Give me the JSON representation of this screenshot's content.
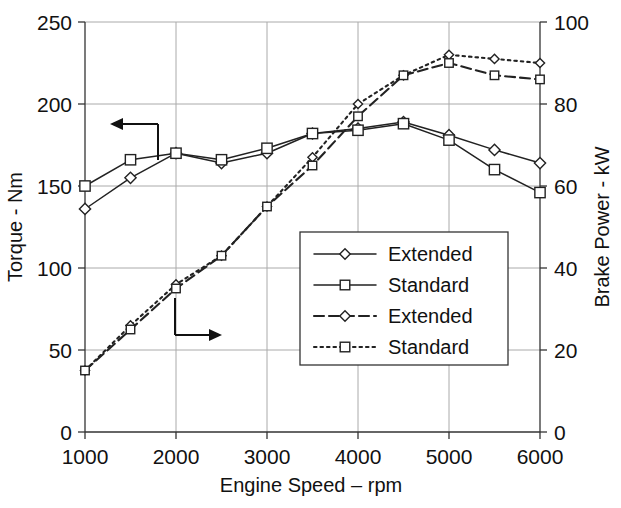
{
  "chart_data": {
    "type": "line",
    "title": "",
    "xlabel": "Engine Speed – rpm",
    "ylabel": "Torque - Nm",
    "y2label": "Brake Power - kW",
    "x": [
      1000,
      1500,
      2000,
      2500,
      3000,
      3500,
      4000,
      4500,
      5000,
      5500,
      6000
    ],
    "xlim": [
      1000,
      6000
    ],
    "ylim": [
      0,
      250
    ],
    "y2lim": [
      0,
      100
    ],
    "xticks": [
      "1000",
      "2000",
      "3000",
      "4000",
      "5000",
      "6000"
    ],
    "yticks": [
      "0",
      "50",
      "100",
      "150",
      "200",
      "250"
    ],
    "y2ticks": [
      "0",
      "20",
      "40",
      "60",
      "80",
      "100"
    ],
    "grid": true,
    "legend_position": "center-right",
    "annotations": [
      {
        "name": "left-axis-arrow",
        "text": "",
        "points_to": "left"
      },
      {
        "name": "right-axis-arrow",
        "text": "",
        "points_to": "right"
      }
    ],
    "series": [
      {
        "name": "Extended",
        "axis": "left",
        "units": "Nm",
        "marker": "diamond",
        "linestyle": "solid",
        "values": [
          136,
          155,
          170,
          164,
          170,
          182,
          185,
          189,
          181,
          172,
          164
        ]
      },
      {
        "name": "Standard",
        "axis": "left",
        "units": "Nm",
        "marker": "square",
        "linestyle": "solid",
        "values": [
          150,
          166,
          170,
          166,
          173,
          182,
          184,
          188,
          178,
          160,
          146
        ]
      },
      {
        "name": "Extended",
        "axis": "right",
        "units": "kW",
        "marker": "diamond",
        "linestyle": "dotted",
        "values": [
          15,
          26,
          36,
          43,
          55,
          67,
          80,
          87,
          92,
          91,
          90
        ]
      },
      {
        "name": "Standard",
        "axis": "right",
        "units": "kW",
        "marker": "square",
        "linestyle": "dashed",
        "values": [
          15,
          25,
          35,
          43,
          55,
          65,
          77,
          87,
          90,
          87,
          86
        ]
      }
    ]
  },
  "legend": {
    "entries": [
      {
        "label": "Extended",
        "marker": "diamond",
        "linestyle": "solid"
      },
      {
        "label": "Standard",
        "marker": "square",
        "linestyle": "solid"
      },
      {
        "label": "Extended",
        "marker": "diamond",
        "linestyle": "dashed"
      },
      {
        "label": "Standard",
        "marker": "square",
        "linestyle": "dotted"
      }
    ]
  },
  "colors": {
    "line": "#222222",
    "grid": "#aaaaaa",
    "axis": "#333333",
    "background": "#ffffff",
    "text": "#111111"
  }
}
